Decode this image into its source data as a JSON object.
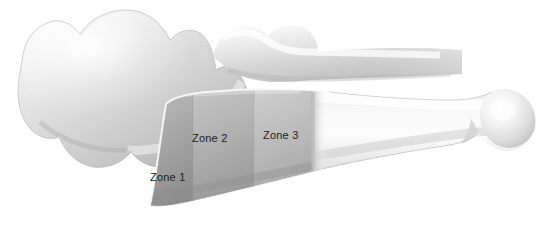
{
  "figure": {
    "background_color": "#ffffff",
    "width": 551,
    "height": 235
  },
  "labels": {
    "zone_1": "Zone 1",
    "zone_2": "Zone 2",
    "zone_3": "Zone 3",
    "text_color": "#1d1d1d"
  },
  "structures": {
    "carpal_bone": {
      "name": "carpal-bone",
      "fill_light": "#f2f2f2",
      "fill_mid": "#cfcfcf",
      "fill_dark": "#b4b4b4"
    },
    "proximal_fragment": {
      "name": "proximal-bone-fragment",
      "fill_light": "#f6f6f6",
      "fill_mid": "#d6d6d6",
      "fill_dark": "#bcbcbc"
    },
    "metacarpal": {
      "name": "metacarpal-bone",
      "shaft_light": "#fbfbfb",
      "shaft_mid": "#dcdcdc",
      "shaft_dark": "#c2c2c2",
      "head_light": "#fafafa",
      "head_shadow": "#c8c8c8"
    }
  },
  "zones": {
    "zone_1": {
      "name": "zone-1-region",
      "fill_top": "#b0b0b0",
      "fill_bottom": "#8f8f8f"
    },
    "zone_2": {
      "name": "zone-2-region",
      "fill_top": "#b9b9b9",
      "fill_bottom": "#9a9a9a"
    },
    "zone_3": {
      "name": "zone-3-region",
      "fill_top": "#c4c4c4",
      "fill_bottom": "#a6a6a6"
    }
  }
}
